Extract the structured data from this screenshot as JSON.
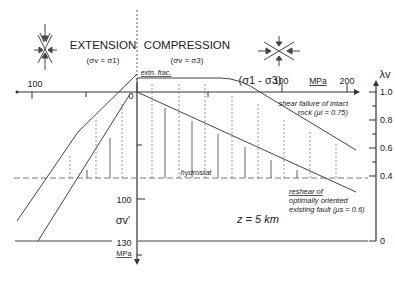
{
  "regimes": {
    "extension": {
      "title": "EXTENSION",
      "condition": "(σv = σ1)"
    },
    "compression": {
      "title": "COMPRESSION",
      "condition": "(σv = σ3)"
    }
  },
  "axes": {
    "x_label": "(σ1 - σ3)",
    "x_unit": "MPa",
    "x_ticks": {
      "left_100": "100",
      "origin": "0",
      "right_100": "100",
      "right_200": "200"
    },
    "y_label": "σv'",
    "y_unit": "MPa",
    "y_ticks": {
      "t100": "100",
      "t130": "130"
    },
    "lambda_label": "λv",
    "lambda_ticks": [
      "1.0",
      "0.8",
      "0.6",
      "0.4",
      "0"
    ]
  },
  "annotations": {
    "extn_frac": "extn. frac.",
    "shear_failure_1": "shear failure of intact",
    "shear_failure_2": "rock (μi = 0.75)",
    "hydrostat": "hydrostat",
    "reshear_1": "reshear of",
    "reshear_2": "optimally oriented",
    "reshear_3": "existing fault (μs = 0.6)",
    "depth": "z = 5 km"
  },
  "colors": {
    "line": "#444444",
    "dash": "#777777",
    "text": "#222222"
  }
}
